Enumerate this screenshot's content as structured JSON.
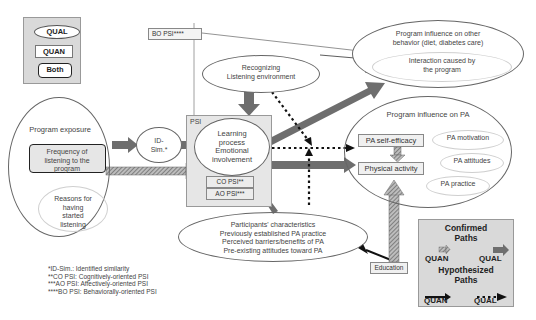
{
  "legend_types": {
    "qual": "QUAL",
    "quan": "QUAN",
    "both": "Both"
  },
  "nodes": {
    "bo_psi": "BO PSI****",
    "recognizing": "Recognizing Listening environment",
    "recognizing_l1": "Recognizing",
    "recognizing_l2": "Listening environment",
    "other_behavior_l1": "Program influence on other",
    "other_behavior_l2": "behavior (diet, diabetes care)",
    "interaction_l1": "Interaction caused by",
    "interaction_l2": "the program",
    "program_exposure": "Program exposure",
    "frequency_l1": "Frequency of",
    "frequency_l2": "listening to the",
    "frequency_l3": "program",
    "reasons_l1": "Reasons for",
    "reasons_l2": "having",
    "reasons_l3": "started",
    "reasons_l4": "listening",
    "id_sim_l1": "ID-",
    "id_sim_l2": "Sim.*",
    "psi": "PSI",
    "learning_l1": "Learning",
    "learning_l2": "process",
    "learning_l3": "Emotional",
    "learning_l4": "involvement",
    "co_psi": "CO PSI**",
    "ao_psi": "AO PSI***",
    "pa_influence": "Program influence on PA",
    "pa_self_efficacy": "PA self-efficacy",
    "physical_activity": "Physical activity",
    "pa_motivation": "PA motivation",
    "pa_attitudes": "PA attitudes",
    "pa_practice": "PA practice",
    "participants_l1": "Participants' characteristics",
    "participants_l2": "Previously established PA practice",
    "participants_l3": "Perceived barriers/benefits of PA",
    "participants_l4": "Pre-existing attitudes toward PA",
    "education": "Education"
  },
  "footnotes": [
    "*ID-Sim.: Identified similarity",
    "**CO PSI: Cognitively-oriented PSI",
    "***AO PSI: Affectively-oriented PSI",
    "****BO PSI: Behaviorally-oriented PSI"
  ],
  "path_legend": {
    "confirmed_l1": "Confirmed",
    "confirmed_l2": "Paths",
    "confirmed_quan": "QUAN",
    "confirmed_qual": "QUAL",
    "hypothesized_l1": "Hypothesized",
    "hypothesized_l2": "Paths",
    "hypothesized_quan": "QUAN",
    "hypothesized_qual": "QUAL"
  },
  "colors": {
    "arrow_gray": "#6e6e6e",
    "box_fill": "#e6e6e6",
    "legend_fill": "#d9d9d9"
  }
}
